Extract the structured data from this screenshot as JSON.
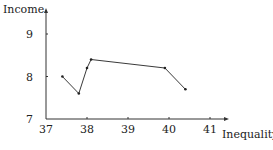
{
  "chart_data": {
    "type": "line",
    "title": "",
    "xlabel": "Inequality",
    "ylabel": "Income",
    "xlim": [
      37,
      41.3
    ],
    "ylim": [
      7,
      9.6
    ],
    "xticks": [
      37,
      38,
      39,
      40,
      41
    ],
    "yticks": [
      7,
      8,
      9
    ],
    "grid": false,
    "legend": null,
    "series": [
      {
        "name": "",
        "x": [
          37.4,
          37.8,
          38.0,
          38.1,
          39.9,
          40.4
        ],
        "y": [
          8.0,
          7.6,
          8.2,
          8.4,
          8.2,
          7.7
        ],
        "color": "#222222"
      }
    ]
  },
  "axes": {
    "x_label": "Inequality",
    "y_label": "Income",
    "x_ticks": [
      "37",
      "38",
      "39",
      "40",
      "41"
    ],
    "y_ticks": [
      "7",
      "8",
      "9"
    ]
  }
}
